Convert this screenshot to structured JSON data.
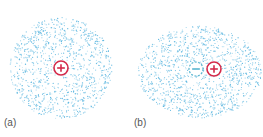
{
  "figure": {
    "panels": [
      {
        "label": "(a)",
        "description": "Spherical electron cloud around a positive nucleus",
        "cloud": {
          "shape": "circle",
          "cx": 61,
          "cy": 68,
          "rx": 51,
          "ry": 51,
          "hole": 12
        },
        "charges": [
          {
            "type": "positive",
            "symbol": "+",
            "cx": 61,
            "cy": 68,
            "r": 7
          }
        ]
      },
      {
        "label": "(b)",
        "description": "Distorted (polarized) electron cloud with induced dipole",
        "cloud": {
          "shape": "ellipse",
          "cx": 200,
          "cy": 72,
          "rx": 62,
          "ry": 46,
          "hole": 14
        },
        "charges": [
          {
            "type": "negative",
            "symbol": "−",
            "cx": 196,
            "cy": 69,
            "r": 7
          },
          {
            "type": "positive",
            "symbol": "+",
            "cx": 214,
            "cy": 69,
            "r": 7
          }
        ]
      }
    ],
    "colors": {
      "cloud_dots": "#5fb8e0",
      "positive_charge": "#d42a4a",
      "negative_charge": "#5bb6d0",
      "label_text": "#555555"
    }
  }
}
